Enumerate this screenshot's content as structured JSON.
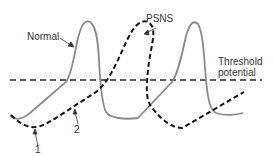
{
  "labels": {
    "normal": "Normal",
    "psns": "PSNS",
    "threshold_line1": "Threshold",
    "threshold_line2": "potential",
    "marker_1": "1",
    "marker_2": "2"
  },
  "colors": {
    "normal_curve": "#8a8a8a",
    "psns_curve": "#111111",
    "threshold_line": "#222222",
    "text": "#333333"
  }
}
